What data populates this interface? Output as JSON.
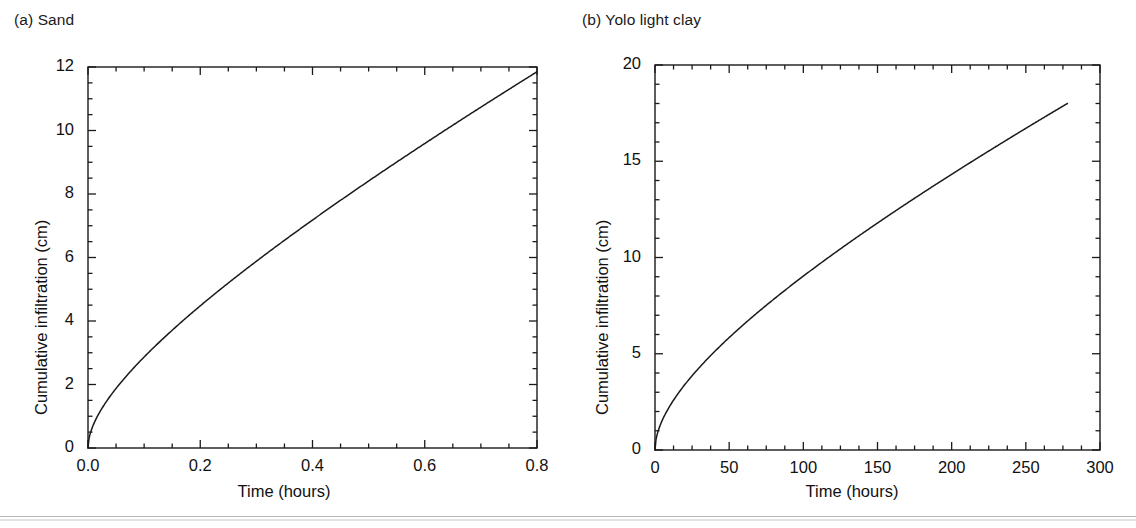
{
  "figure": {
    "background": "#ffffff",
    "line_color": "#1a1a1a",
    "axis_color": "#1a1a1a"
  },
  "panels": [
    {
      "id": "a",
      "label": "(a) Sand",
      "xlabel": "Time (hours)",
      "ylabel": "Cumulative infiltration (cm)",
      "xticks": [
        "0.0",
        "0.2",
        "0.4",
        "0.6",
        "0.8"
      ],
      "yticks": [
        "0",
        "2",
        "4",
        "6",
        "8",
        "10",
        "12"
      ]
    },
    {
      "id": "b",
      "label": "(b) Yolo light clay",
      "xlabel": "Time (hours)",
      "ylabel": "Cumulative infiltration (cm)",
      "xticks": [
        "0",
        "50",
        "100",
        "150",
        "200",
        "250",
        "300"
      ],
      "yticks": [
        "0",
        "5",
        "10",
        "15",
        "20"
      ]
    }
  ],
  "chart_data": [
    {
      "type": "line",
      "panel": "a",
      "title": "(a) Sand",
      "xlabel": "Time (hours)",
      "ylabel": "Cumulative infiltration (cm)",
      "xlim": [
        0.0,
        0.8
      ],
      "ylim": [
        0,
        12
      ],
      "xticks": [
        0.0,
        0.2,
        0.4,
        0.6,
        0.8
      ],
      "yticks": [
        0,
        2,
        4,
        6,
        8,
        10,
        12
      ],
      "xminor_step": 0.05,
      "yminor_step": 0.5,
      "grid": false,
      "legend": null,
      "series": [
        {
          "name": "Sand cumulative infiltration",
          "x": [
            0.0,
            0.005,
            0.01,
            0.02,
            0.03,
            0.04,
            0.05,
            0.06,
            0.08,
            0.1,
            0.12,
            0.15,
            0.18,
            0.2,
            0.25,
            0.3,
            0.35,
            0.4,
            0.45,
            0.5,
            0.55,
            0.6,
            0.65,
            0.7,
            0.75,
            0.8
          ],
          "y": [
            0.0,
            0.3,
            0.44,
            0.65,
            0.82,
            0.97,
            1.11,
            1.24,
            1.48,
            1.7,
            1.91,
            2.21,
            2.49,
            2.67,
            3.1,
            3.51,
            3.9,
            4.28,
            4.65,
            5.01,
            5.36,
            5.71,
            6.05,
            6.38,
            6.72,
            7.05
          ]
        }
      ],
      "y_display_max_at_xmax": 11.85,
      "note": "Philip-type curve I = S*sqrt(t) + A*t; steep sqrt rise then near-linear"
    },
    {
      "type": "line",
      "panel": "b",
      "title": "(b) Yolo light clay",
      "xlabel": "Time (hours)",
      "ylabel": "Cumulative infiltration (cm)",
      "xlim": [
        0,
        300
      ],
      "ylim": [
        0,
        20
      ],
      "xticks": [
        0,
        50,
        100,
        150,
        200,
        250,
        300
      ],
      "yticks": [
        0,
        5,
        10,
        15,
        20
      ],
      "xminor_step": 12.5,
      "yminor_step": 1,
      "grid": false,
      "legend": null,
      "series": [
        {
          "name": "Yolo light clay cumulative infiltration",
          "x": [
            0,
            1,
            2,
            4,
            6,
            10,
            15,
            20,
            30,
            40,
            50,
            60,
            80,
            100,
            120,
            140,
            160,
            180,
            200,
            220,
            240,
            260,
            278
          ],
          "y": [
            0.0,
            0.55,
            0.8,
            1.2,
            1.5,
            2.0,
            2.5,
            2.95,
            3.75,
            4.45,
            5.1,
            5.7,
            6.85,
            7.9,
            8.9,
            9.85,
            10.75,
            11.65,
            12.5,
            13.35,
            14.2,
            15.0,
            15.7
          ]
        }
      ],
      "y_display_max_at_xmax": 18.0,
      "note": "Philip-type curve with larger sorptivity relative to slope; ends near t=278 h, I=18 cm"
    }
  ]
}
